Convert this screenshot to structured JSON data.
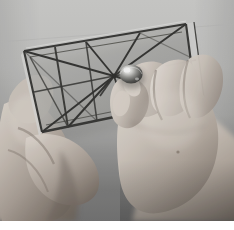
{
  "image": {
    "kind": "photograph",
    "subject": "hands-holding-wire-frame",
    "description": "Two hands holding a rectangular wire frame panel with diagonal struts radiating from a central hub; right hand fingers grip a shiny metal bead at the hub.",
    "color_mode": "grayscale",
    "width_px": 234,
    "height_px": 230,
    "photo_height_px": 221,
    "border_text": ""
  },
  "palette": {
    "page_background": "#ffffff",
    "backdrop_top": "#cbcbc9",
    "backdrop_upper_mid": "#c2c2c0",
    "backdrop_lower_mid": "#8f8f8e",
    "backdrop_bottom": "#6e6e6e",
    "skin_light": "#cfc6bd",
    "skin_mid": "#b3a89e",
    "skin_shadow": "#7d7268",
    "skin_deep_shadow": "#584f48",
    "skin_highlight": "#e3dcd4",
    "panel_glass": "#a9a9a6",
    "panel_glass_light": "#b8b8b5",
    "wire_dark": "#2a2a28",
    "wire_mid": "#4a4a46",
    "wire_edge_highlight": "#e8e8e6",
    "bead_highlight": "#f2f2f0",
    "bead_mid": "#8a8a86",
    "bead_dark": "#2d2d2b",
    "nail_light": "#ded6cd"
  },
  "scene": {
    "objects": [
      {
        "name": "backdrop",
        "label": "Studio backdrop surface"
      },
      {
        "name": "wire-frame-panel",
        "label": "Rectangular wire frame panel"
      },
      {
        "name": "left-hand",
        "label": "Left hand supporting panel edge"
      },
      {
        "name": "right-hand",
        "label": "Right hand gripping central bead"
      },
      {
        "name": "metal-bead",
        "label": "Shiny metal bead at hub"
      }
    ],
    "frame": {
      "corners": {
        "top_left": [
          24,
          51
        ],
        "top_right": [
          186,
          24
        ],
        "bottom_right": [
          196,
          100
        ],
        "bottom_left": [
          42,
          132
        ]
      },
      "hub": [
        114,
        76
      ],
      "strut_count": 9
    }
  },
  "labels": {
    "photo_title": ""
  }
}
